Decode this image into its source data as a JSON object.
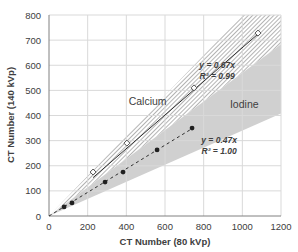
{
  "chart_data": {
    "type": "scatter",
    "title": "",
    "xlabel": "CT Number (80 kVp)",
    "ylabel": "CT Number (140 kVp)",
    "xlim": [
      0,
      1200
    ],
    "ylim": [
      0,
      800
    ],
    "x_ticks": [
      0,
      200,
      400,
      600,
      800,
      1000,
      1200
    ],
    "y_ticks": [
      0,
      100,
      200,
      300,
      400,
      500,
      600,
      700,
      800
    ],
    "grid": true,
    "legend": null,
    "series": [
      {
        "name": "Calcium",
        "marker": "open-diamond",
        "line": "solid",
        "points": [
          [
            228,
            175
          ],
          [
            403,
            290
          ],
          [
            750,
            510
          ],
          [
            1081,
            728
          ]
        ],
        "fit": {
          "equation": "y = 0.67x",
          "r2_label": "R² = 0.99",
          "slope": 0.67
        }
      },
      {
        "name": "Iodine",
        "marker": "filled-circle",
        "line": "dashed",
        "points": [
          [
            78,
            36
          ],
          [
            119,
            52
          ],
          [
            290,
            135
          ],
          [
            383,
            175
          ],
          [
            559,
            263
          ],
          [
            740,
            350
          ]
        ],
        "fit": {
          "equation": "y = 0.47x",
          "r2_label": "R² = 1.00",
          "slope": 0.47
        }
      }
    ],
    "regions": [
      {
        "name": "Calcium",
        "fill": "hatched",
        "slope_upper": 0.8,
        "slope_lower": 0.57
      },
      {
        "name": "Iodine",
        "fill": "#d0d0d0",
        "slope_upper": 0.57,
        "slope_lower": 0.34
      }
    ],
    "annotations": [
      {
        "text": "Calcium",
        "x": 510,
        "y": 440
      },
      {
        "text": "Iodine",
        "x": 1010,
        "y": 430
      },
      {
        "text": "y = 0.67x",
        "x": 870,
        "y": 590
      },
      {
        "text": "R² = 0.99",
        "x": 870,
        "y": 545
      },
      {
        "text": "y = 0.47x",
        "x": 880,
        "y": 290
      },
      {
        "text": "R² = 1.00",
        "x": 880,
        "y": 248
      }
    ]
  },
  "colors": {
    "grid": "#d9d9d9",
    "axis": "#808080",
    "iodine_region": "#d0d0d0",
    "hatch": "#9a9a9a",
    "marker": "#202020",
    "text": "#404040"
  }
}
